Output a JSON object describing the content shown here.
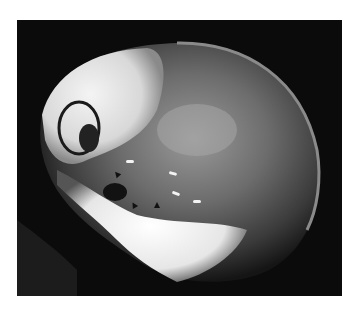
{
  "image": {
    "subject": "lateral skull radiograph",
    "background_color": "#ffffff",
    "film_color": "#0b0b0b",
    "bone_color": "#f2f2f2",
    "annotations": {
      "white_markers": 4,
      "black_arrows": 3
    }
  }
}
